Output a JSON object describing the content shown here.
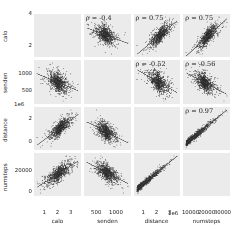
{
  "chart_data": {
    "type": "scatter",
    "title": "",
    "subtitle": "",
    "layout": "pairplot-matrix-4x4",
    "grid": true,
    "panel_background": "#ebebeb",
    "point_color": "#3a3a3a",
    "fit_line_color": "#555555",
    "variables": [
      "calo",
      "senden",
      "distance",
      "numsteps"
    ],
    "axes": [
      {
        "name": "calo",
        "label": "calo",
        "ticks": [
          1,
          2,
          3
        ],
        "tick_labels": [
          "1",
          "2",
          "3"
        ],
        "y_ticks": [
          2,
          4
        ],
        "y_tick_labels": [
          "2",
          "4"
        ],
        "exponent": "",
        "range": [
          0.5,
          3.8
        ]
      },
      {
        "name": "senden",
        "label": "senden",
        "ticks": [
          500,
          1000
        ],
        "tick_labels": [
          "500",
          "1000"
        ],
        "y_ticks": [
          500,
          1000
        ],
        "y_tick_labels": [
          "500",
          "1000"
        ],
        "exponent": "",
        "range": [
          250,
          1350
        ]
      },
      {
        "name": "distance",
        "label": "distance",
        "ticks": [
          1,
          2,
          3
        ],
        "tick_labels": [
          "1",
          "2",
          "3"
        ],
        "y_ticks": [
          0,
          2
        ],
        "y_tick_labels": [
          "0",
          "2"
        ],
        "exponent": "1e6",
        "range": [
          0,
          3.6
        ]
      },
      {
        "name": "numsteps",
        "label": "numsteps",
        "ticks": [
          10000,
          20000,
          30000
        ],
        "tick_labels": [
          "10000",
          "20000",
          "30000"
        ],
        "y_ticks": [
          0,
          20000
        ],
        "y_tick_labels": [
          "0",
          "20000"
        ],
        "exponent": "",
        "range": [
          0,
          36000
        ]
      }
    ],
    "correlations": [
      {
        "row": 0,
        "col": 1,
        "x": "senden",
        "y": "calo",
        "label": "ρ = -0.4",
        "value": -0.4
      },
      {
        "row": 0,
        "col": 2,
        "x": "distance",
        "y": "calo",
        "label": "ρ = 0.75",
        "value": 0.75
      },
      {
        "row": 0,
        "col": 3,
        "x": "numsteps",
        "y": "calo",
        "label": "ρ = 0.75",
        "value": 0.75
      },
      {
        "row": 1,
        "col": 2,
        "x": "distance",
        "y": "senden",
        "label": "ρ = -0.52",
        "value": -0.52
      },
      {
        "row": 1,
        "col": 3,
        "x": "numsteps",
        "y": "senden",
        "label": "ρ = -0.56",
        "value": -0.56
      },
      {
        "row": 2,
        "col": 3,
        "x": "numsteps",
        "y": "distance",
        "label": "ρ = 0.97",
        "value": 0.97
      }
    ],
    "panels": [
      {
        "row": 0,
        "col": 0,
        "kind": "blank"
      },
      {
        "row": 0,
        "col": 1,
        "kind": "scatter",
        "n": 900,
        "r": -0.4,
        "fit": true
      },
      {
        "row": 0,
        "col": 2,
        "kind": "scatter",
        "n": 900,
        "r": 0.75,
        "fit": true
      },
      {
        "row": 0,
        "col": 3,
        "kind": "scatter",
        "n": 900,
        "r": 0.75,
        "fit": true
      },
      {
        "row": 1,
        "col": 0,
        "kind": "scatter",
        "n": 900,
        "r": -0.4,
        "fit": true
      },
      {
        "row": 1,
        "col": 1,
        "kind": "blank"
      },
      {
        "row": 1,
        "col": 2,
        "kind": "scatter",
        "n": 900,
        "r": -0.52,
        "fit": true
      },
      {
        "row": 1,
        "col": 3,
        "kind": "scatter",
        "n": 900,
        "r": -0.56,
        "fit": true
      },
      {
        "row": 2,
        "col": 0,
        "kind": "scatter",
        "n": 900,
        "r": 0.75,
        "fit": true
      },
      {
        "row": 2,
        "col": 1,
        "kind": "scatter",
        "n": 900,
        "r": -0.52,
        "fit": true
      },
      {
        "row": 2,
        "col": 2,
        "kind": "blank"
      },
      {
        "row": 2,
        "col": 3,
        "kind": "scatter",
        "n": 900,
        "r": 0.97,
        "fit": true
      },
      {
        "row": 3,
        "col": 0,
        "kind": "scatter",
        "n": 900,
        "r": 0.75,
        "fit": true
      },
      {
        "row": 3,
        "col": 1,
        "kind": "scatter",
        "n": 900,
        "r": -0.56,
        "fit": true
      },
      {
        "row": 3,
        "col": 2,
        "kind": "scatter",
        "n": 900,
        "r": 0.97,
        "fit": true
      },
      {
        "row": 3,
        "col": 3,
        "kind": "blank"
      }
    ]
  }
}
